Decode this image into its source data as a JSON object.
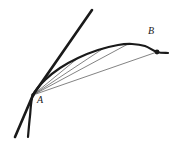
{
  "figure": {
    "width": 173,
    "height": 142,
    "background": "#ffffff",
    "ink_color": "#1a1a1a",
    "secant_color": "#4d4d4d"
  },
  "labels": {
    "point_a": "A",
    "point_b": "B"
  },
  "points": {
    "A": {
      "x": 33,
      "y": 95
    },
    "B": {
      "x": 157,
      "y": 52
    }
  },
  "chart_data": {
    "type": "line",
    "title": "",
    "xlabel": "",
    "ylabel": "",
    "grid": false,
    "legend": null,
    "xlim": [
      0,
      173
    ],
    "ylim": [
      142,
      0
    ],
    "annotations": [
      {
        "text": "A",
        "x": 41,
        "y": 103
      },
      {
        "text": "B",
        "x": 152,
        "y": 34
      }
    ],
    "series": [
      {
        "name": "tangent-line",
        "style": "thick",
        "width": 2.6,
        "x": [
          15,
          33,
          92
        ],
        "y": [
          137,
          95,
          10
        ]
      },
      {
        "name": "curve",
        "style": "thick",
        "width": 2.2,
        "x": [
          28,
          30,
          33,
          45,
          60,
          78,
          98,
          118,
          132,
          145,
          157,
          168
        ],
        "y": [
          137,
          116,
          95,
          80,
          68,
          58,
          50,
          45,
          44,
          46,
          52,
          53
        ]
      },
      {
        "name": "secant-1",
        "style": "thin",
        "width": 0.7,
        "x": [
          33,
          78
        ],
        "y": [
          95,
          58
        ]
      },
      {
        "name": "secant-2",
        "style": "thin",
        "width": 0.7,
        "x": [
          33,
          104
        ],
        "y": [
          95,
          48
        ]
      },
      {
        "name": "secant-3",
        "style": "thin",
        "width": 0.7,
        "x": [
          33,
          128
        ],
        "y": [
          95,
          44
        ]
      },
      {
        "name": "secant-4",
        "style": "thin",
        "width": 0.7,
        "x": [
          33,
          157
        ],
        "y": [
          95,
          52
        ]
      }
    ]
  }
}
